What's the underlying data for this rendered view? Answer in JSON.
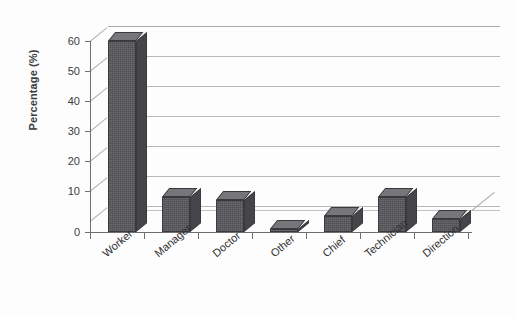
{
  "chart_data": {
    "type": "bar",
    "title": "",
    "xlabel": "",
    "ylabel": "Percentage (%)",
    "categories": [
      "Worker",
      "Manager",
      "Doctor",
      "Other",
      "Chief",
      "Technician",
      "Direction"
    ],
    "values": [
      60,
      11,
      10,
      1,
      5,
      11,
      4
    ],
    "ylim": [
      0,
      60
    ],
    "ytick_labels": [
      "0",
      "10",
      "20",
      "30",
      "40",
      "50",
      "60"
    ],
    "ytick_values": [
      0,
      10,
      20,
      30,
      40,
      50,
      60
    ],
    "grid": true,
    "grid_axis": "y",
    "legend": false,
    "legend_position": "none",
    "style": "3d-column",
    "bar_color": "#57575c",
    "bar_top_color": "#76767b",
    "bar_side_color": "#45454a",
    "grid_color": "#b9b9b9",
    "axis_color": "#6f6f6f",
    "background": "#fdfdfd",
    "series": [
      {
        "name": "Percentage (%)",
        "values": [
          60,
          11,
          10,
          1,
          5,
          11,
          4
        ]
      }
    ]
  },
  "axes": {
    "y_title": "Percentage (%)"
  }
}
